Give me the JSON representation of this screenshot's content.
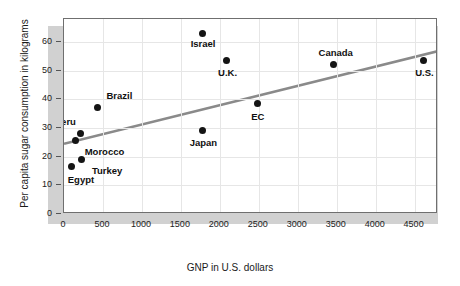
{
  "chart_data": {
    "type": "scatter",
    "title": "",
    "xlabel": "GNP in U.S. dollars",
    "ylabel": "Per capita sugar consumption in kilograms",
    "xlim": [
      0,
      4800
    ],
    "ylim": [
      0,
      68
    ],
    "xticks": [
      0,
      500,
      1000,
      1500,
      2000,
      2500,
      3000,
      3500,
      4000,
      4500
    ],
    "yticks": [
      0,
      10,
      20,
      30,
      40,
      50,
      60
    ],
    "grid": true,
    "legend": "none",
    "points": [
      {
        "label": "Egypt",
        "x": 100,
        "y": 16.5,
        "label_dx": -4,
        "label_dy": 13
      },
      {
        "label": "Morocco",
        "x": 150,
        "y": 25.5,
        "label_dx": 9,
        "label_dy": 11
      },
      {
        "label": "Turkey",
        "x": 230,
        "y": 19,
        "label_dx": 10,
        "label_dy": 11
      },
      {
        "label": "Peru",
        "x": 215,
        "y": 28,
        "label_dx": -26,
        "label_dy": -12
      },
      {
        "label": "Brazil",
        "x": 430,
        "y": 37,
        "label_dx": 9,
        "label_dy": -12
      },
      {
        "label": "Israel",
        "x": 1780,
        "y": 63,
        "label_dx": -12,
        "label_dy": 11
      },
      {
        "label": "U.K.",
        "x": 2080,
        "y": 53.5,
        "label_dx": -8,
        "label_dy": 12
      },
      {
        "label": "Japan",
        "x": 1780,
        "y": 29,
        "label_dx": -13,
        "label_dy": 12
      },
      {
        "label": "EC",
        "x": 2480,
        "y": 38.5,
        "label_dx": -6,
        "label_dy": 13
      },
      {
        "label": "Canada",
        "x": 3460,
        "y": 52,
        "label_dx": -15,
        "label_dy": -12
      },
      {
        "label": "U.S.",
        "x": 4610,
        "y": 53.5,
        "label_dx": -8,
        "label_dy": 12
      }
    ],
    "trendline": {
      "x1": 0,
      "y1": 24.5,
      "x2": 4800,
      "y2": 56.8,
      "color": "#8a8a8a"
    },
    "colors": {
      "point": "#141414",
      "trend": "#8a8a8a",
      "grid": "#e6e6e6",
      "frame": "#6f6f6f",
      "shadow": "#c9c9c9"
    }
  }
}
